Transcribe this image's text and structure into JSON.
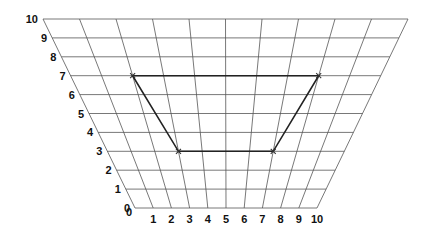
{
  "diagram": {
    "grid": {
      "x_min": 0,
      "x_max": 10,
      "y_min": 0,
      "y_max": 10,
      "bottom_left_px": [
        135,
        208
      ],
      "bottom_right_px": [
        317,
        208
      ],
      "top_left_px": [
        43,
        19
      ],
      "top_right_px": [
        408,
        19
      ],
      "line_color": "#555555"
    },
    "x_axis_labels": [
      "0",
      "1",
      "2",
      "3",
      "4",
      "5",
      "6",
      "7",
      "8",
      "9",
      "10"
    ],
    "y_axis_labels": [
      "0",
      "1",
      "2",
      "3",
      "4",
      "5",
      "6",
      "7",
      "8",
      "9",
      "10"
    ],
    "shape": {
      "type": "quadrilateral",
      "vertices": [
        {
          "x": 2,
          "y": 7
        },
        {
          "x": 8,
          "y": 7
        },
        {
          "x": 7,
          "y": 3
        },
        {
          "x": 3,
          "y": 3
        }
      ],
      "vertex_marker": "x",
      "edge_color": "#222222"
    }
  }
}
